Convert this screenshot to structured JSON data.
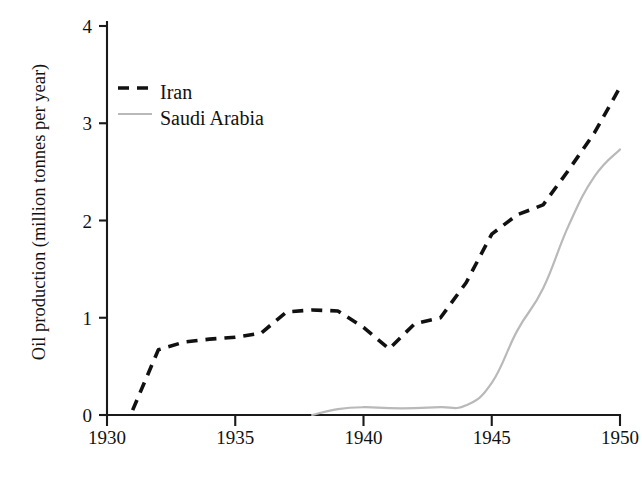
{
  "chart_data": {
    "type": "line",
    "title": "",
    "xlabel": "",
    "ylabel": "Oil production (million tonnes per year)",
    "xlim": [
      1930,
      1950
    ],
    "ylim": [
      0,
      4
    ],
    "xticks": [
      "1930",
      "1935",
      "1940",
      "1945",
      "1950"
    ],
    "yticks": [
      "0",
      "1",
      "2",
      "3",
      "4"
    ],
    "grid": false,
    "legend_position": "top-left",
    "series": [
      {
        "name": "Iran",
        "color": "#111111",
        "style": "dashed",
        "x": [
          1931,
          1932,
          1933,
          1934,
          1935,
          1936,
          1937,
          1938,
          1939,
          1940,
          1941,
          1942,
          1943,
          1944,
          1945,
          1946,
          1947,
          1948,
          1949,
          1950
        ],
        "values": [
          0.05,
          0.67,
          0.75,
          0.78,
          0.8,
          0.84,
          1.06,
          1.08,
          1.07,
          0.9,
          0.68,
          0.94,
          1.0,
          1.36,
          1.86,
          2.06,
          2.16,
          2.52,
          2.9,
          3.37
        ]
      },
      {
        "name": "Saudi Arabia",
        "color": "#b9b9b9",
        "style": "solid",
        "x": [
          1938,
          1939,
          1940,
          1941,
          1942,
          1943,
          1944,
          1945,
          1946,
          1947,
          1948,
          1949,
          1950
        ],
        "values": [
          0.0,
          0.06,
          0.08,
          0.07,
          0.07,
          0.08,
          0.1,
          0.33,
          0.87,
          1.3,
          1.95,
          2.45,
          2.73
        ]
      }
    ]
  },
  "legend": {
    "entries": [
      {
        "label": "Iran",
        "swatch": "dashed-line-swatch"
      },
      {
        "label": "Saudi Arabia",
        "swatch": "solid-line-swatch"
      }
    ]
  },
  "axes": {
    "y_title": "Oil production (million tonnes per year)",
    "x_tick_labels": [
      "1930",
      "1935",
      "1940",
      "1945",
      "1950"
    ],
    "y_tick_labels": [
      "0",
      "1",
      "2",
      "3",
      "4"
    ]
  }
}
